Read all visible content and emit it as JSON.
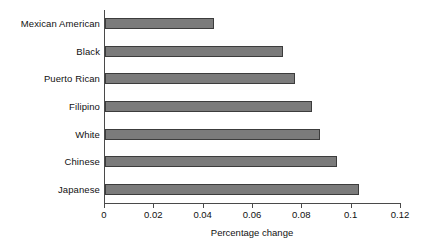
{
  "chart_data": {
    "type": "bar",
    "orientation": "horizontal",
    "title": "",
    "xlabel": "Percentage change",
    "ylabel": "",
    "categories": [
      "Mexican American",
      "Black",
      "Puerto Rican",
      "Filipino",
      "White",
      "Chinese",
      "Japanese"
    ],
    "values": [
      0.044,
      0.072,
      0.077,
      0.084,
      0.087,
      0.094,
      0.103
    ],
    "xlim": [
      0,
      0.12
    ],
    "xticks": [
      0,
      0.02,
      0.04,
      0.06,
      0.08,
      0.1,
      0.12
    ],
    "xtick_labels": [
      "0",
      "0.02",
      "0.04",
      "0.06",
      "0.08",
      "0.1",
      "0.12"
    ],
    "grid": false,
    "legend": false,
    "bar_color": "#7b7b7b",
    "bar_edge_color": "#3c3c3c",
    "axis_color": "#4a4a4a",
    "background": "#ffffff"
  },
  "axis": {
    "x_title": "Percentage change"
  }
}
